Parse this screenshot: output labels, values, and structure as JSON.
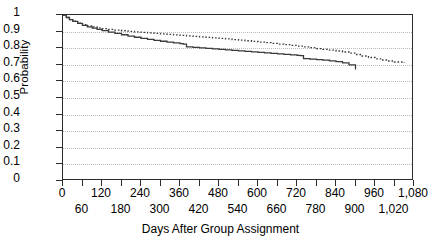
{
  "chart_data": {
    "type": "line",
    "title": "",
    "subtitle": "",
    "xlabel": "Days After Group Assignment",
    "ylabel": "Probability",
    "xlim": [
      0,
      1080
    ],
    "ylim": [
      0,
      1
    ],
    "grid": true,
    "grid_axis": "y",
    "legend": null,
    "legend_position": "none",
    "x_tick_values": [
      0,
      60,
      120,
      180,
      240,
      300,
      360,
      420,
      480,
      540,
      600,
      660,
      720,
      780,
      840,
      900,
      960,
      1020,
      1080
    ],
    "x_tick_labels": [
      "0",
      "60",
      "120",
      "180",
      "240",
      "300",
      "360",
      "420",
      "480",
      "540",
      "600",
      "660",
      "720",
      "780",
      "840",
      "900",
      "960",
      "1,020",
      "1,080"
    ],
    "x_tick_rows": [
      0,
      1,
      0,
      1,
      0,
      1,
      0,
      1,
      0,
      1,
      0,
      1,
      0,
      1,
      0,
      1,
      0,
      1,
      0
    ],
    "y_tick_values": [
      0,
      0.1,
      0.2,
      0.3,
      0.4,
      0.5,
      0.6,
      0.7,
      0.8,
      0.9,
      1
    ],
    "y_tick_labels": [
      "0",
      "0.1",
      "0.2",
      "0.3",
      "0.4",
      "0.5",
      "0.6",
      "0.7",
      "0.8",
      "0.9",
      "1"
    ],
    "series": [
      {
        "name": "solid-curve",
        "style": "solid",
        "color": "#3a3a3a",
        "width": 1.3,
        "x": [
          0,
          10,
          20,
          30,
          45,
          60,
          75,
          90,
          105,
          120,
          140,
          160,
          180,
          200,
          220,
          240,
          260,
          280,
          300,
          320,
          340,
          360,
          370,
          380,
          400,
          420,
          440,
          460,
          480,
          500,
          520,
          540,
          560,
          580,
          600,
          620,
          640,
          660,
          680,
          700,
          720,
          730,
          740,
          760,
          780,
          800,
          820,
          840,
          860,
          880,
          900
        ],
        "y": [
          1.0,
          0.985,
          0.972,
          0.962,
          0.949,
          0.938,
          0.929,
          0.921,
          0.913,
          0.906,
          0.897,
          0.889,
          0.881,
          0.873,
          0.866,
          0.859,
          0.853,
          0.847,
          0.842,
          0.837,
          0.832,
          0.827,
          0.824,
          0.808,
          0.805,
          0.802,
          0.799,
          0.796,
          0.793,
          0.79,
          0.787,
          0.784,
          0.781,
          0.778,
          0.775,
          0.772,
          0.769,
          0.766,
          0.763,
          0.76,
          0.757,
          0.755,
          0.737,
          0.734,
          0.731,
          0.728,
          0.724,
          0.719,
          0.712,
          0.7,
          0.672
        ]
      },
      {
        "name": "dotted-curve",
        "style": "dotted",
        "color": "#3a3a3a",
        "width": 1.3,
        "x": [
          0,
          10,
          20,
          30,
          45,
          60,
          75,
          90,
          105,
          120,
          140,
          160,
          180,
          200,
          220,
          240,
          260,
          280,
          300,
          320,
          340,
          360,
          380,
          400,
          420,
          440,
          460,
          480,
          500,
          520,
          540,
          560,
          580,
          600,
          620,
          640,
          660,
          680,
          700,
          720,
          740,
          760,
          780,
          800,
          820,
          840,
          860,
          880,
          900,
          920,
          940,
          960,
          980,
          1000,
          1020,
          1050
        ],
        "y": [
          1.0,
          0.985,
          0.972,
          0.963,
          0.951,
          0.942,
          0.934,
          0.928,
          0.922,
          0.918,
          0.913,
          0.909,
          0.905,
          0.901,
          0.898,
          0.895,
          0.892,
          0.889,
          0.886,
          0.883,
          0.88,
          0.877,
          0.874,
          0.871,
          0.868,
          0.865,
          0.862,
          0.859,
          0.856,
          0.852,
          0.849,
          0.845,
          0.841,
          0.837,
          0.833,
          0.829,
          0.825,
          0.821,
          0.817,
          0.813,
          0.808,
          0.803,
          0.798,
          0.793,
          0.788,
          0.783,
          0.777,
          0.77,
          0.762,
          0.753,
          0.744,
          0.736,
          0.729,
          0.723,
          0.717,
          0.712
        ]
      }
    ]
  },
  "axis": {
    "frame_color": "#2b2b2b",
    "grid_color": "#b9b9b9"
  }
}
